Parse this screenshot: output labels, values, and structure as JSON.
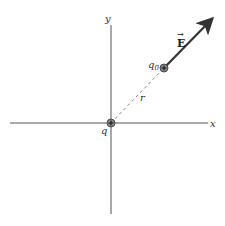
{
  "diagram": {
    "axes": {
      "x_label": "x",
      "y_label": "y"
    },
    "source_charge": {
      "label": "q",
      "sign": "+",
      "position": [
        111,
        123
      ]
    },
    "test_charge": {
      "label": "q",
      "subscript": "0",
      "sign": "+",
      "position": [
        164,
        68
      ]
    },
    "distance_label": "r",
    "field_vector": {
      "label": "E",
      "accent": "→",
      "color": "#333333"
    },
    "colors": {
      "axis": "#555555",
      "charge_fill": "#888888",
      "dashed": "#888888"
    }
  }
}
